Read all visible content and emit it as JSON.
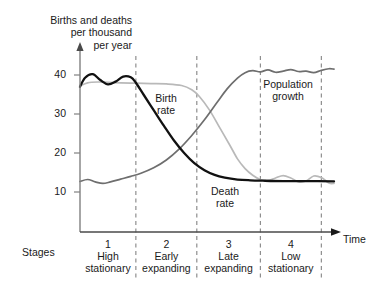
{
  "axis_title": "Births and deaths\nper thousand\nper year",
  "x_axis_label": "Time",
  "stages_label": "Stages",
  "colors": {
    "death_rate": "#111111",
    "birth_rate": "#b9b9b9",
    "population_growth": "#6e6e6e",
    "axis": "#808080",
    "divider": "#777777",
    "text": "#1a1a1a"
  },
  "curve_labels": {
    "birth_rate": "Birth\nrate",
    "death_rate": "Death\nrate",
    "population_growth": "Population\ngrowth"
  },
  "chart_data": {
    "type": "line",
    "xlabel": "Time",
    "ylabel": "Births and deaths per thousand per year",
    "ylim": [
      0,
      45
    ],
    "yticks": [
      10,
      20,
      30,
      40
    ],
    "ytick_labels": [
      "10",
      "20",
      "30",
      "40"
    ],
    "grid": false,
    "legend": "inline-annotations",
    "stages": [
      {
        "number": "1",
        "name": "High\nstationary",
        "name_line1": "High",
        "name_line2": "stationary"
      },
      {
        "number": "2",
        "name": "Early\nexpanding",
        "name_line1": "Early",
        "name_line2": "expanding"
      },
      {
        "number": "3",
        "name": "Late\nexpanding",
        "name_line1": "Late",
        "name_line2": "expanding"
      },
      {
        "number": "4",
        "name": "Low\nstationary",
        "name_line1": "Low",
        "name_line2": "stationary"
      }
    ],
    "stage_boundaries_x": [
      0.0,
      0.22,
      0.46,
      0.71,
      0.95
    ],
    "series": [
      {
        "name": "Birth rate",
        "color": "#b9b9b9",
        "x": [
          0.0,
          0.03,
          0.07,
          0.11,
          0.16,
          0.22,
          0.28,
          0.34,
          0.4,
          0.44,
          0.47,
          0.51,
          0.55,
          0.59,
          0.62,
          0.65,
          0.68,
          0.71,
          0.74,
          0.77,
          0.8,
          0.83,
          0.86,
          0.89,
          0.92,
          0.95,
          0.98,
          1.0
        ],
        "values": [
          37.2,
          38.0,
          38.2,
          38.1,
          38.0,
          37.9,
          37.8,
          37.7,
          37.3,
          36.2,
          34.5,
          31.0,
          26.5,
          22.0,
          18.5,
          16.0,
          14.3,
          13.2,
          12.9,
          13.6,
          14.2,
          13.6,
          12.6,
          12.8,
          14.1,
          13.7,
          12.3,
          12.2
        ]
      },
      {
        "name": "Death rate",
        "color": "#111111",
        "x": [
          0.0,
          0.02,
          0.05,
          0.08,
          0.11,
          0.14,
          0.17,
          0.2,
          0.22,
          0.25,
          0.29,
          0.33,
          0.37,
          0.41,
          0.45,
          0.49,
          0.53,
          0.57,
          0.62,
          0.67,
          0.72,
          0.8,
          0.9,
          1.0
        ],
        "values": [
          37.0,
          39.3,
          40.2,
          38.7,
          37.6,
          38.3,
          39.6,
          39.4,
          38.0,
          35.0,
          31.0,
          27.0,
          23.2,
          20.0,
          17.4,
          15.6,
          14.4,
          13.7,
          13.2,
          13.0,
          12.9,
          12.8,
          12.8,
          12.7
        ]
      },
      {
        "name": "Population growth",
        "color": "#6e6e6e",
        "x": [
          0.0,
          0.03,
          0.06,
          0.09,
          0.12,
          0.16,
          0.2,
          0.24,
          0.29,
          0.34,
          0.39,
          0.44,
          0.49,
          0.54,
          0.58,
          0.62,
          0.65,
          0.68,
          0.71,
          0.74,
          0.77,
          0.8,
          0.83,
          0.86,
          0.89,
          0.92,
          0.95,
          0.98,
          1.0
        ],
        "values": [
          12.7,
          13.2,
          12.6,
          12.2,
          12.6,
          13.3,
          14.0,
          14.8,
          16.2,
          18.2,
          21.0,
          24.5,
          28.5,
          33.0,
          36.5,
          39.2,
          40.6,
          41.1,
          40.8,
          41.3,
          40.7,
          41.0,
          41.4,
          40.9,
          41.0,
          40.6,
          41.2,
          41.6,
          41.5
        ]
      }
    ]
  }
}
